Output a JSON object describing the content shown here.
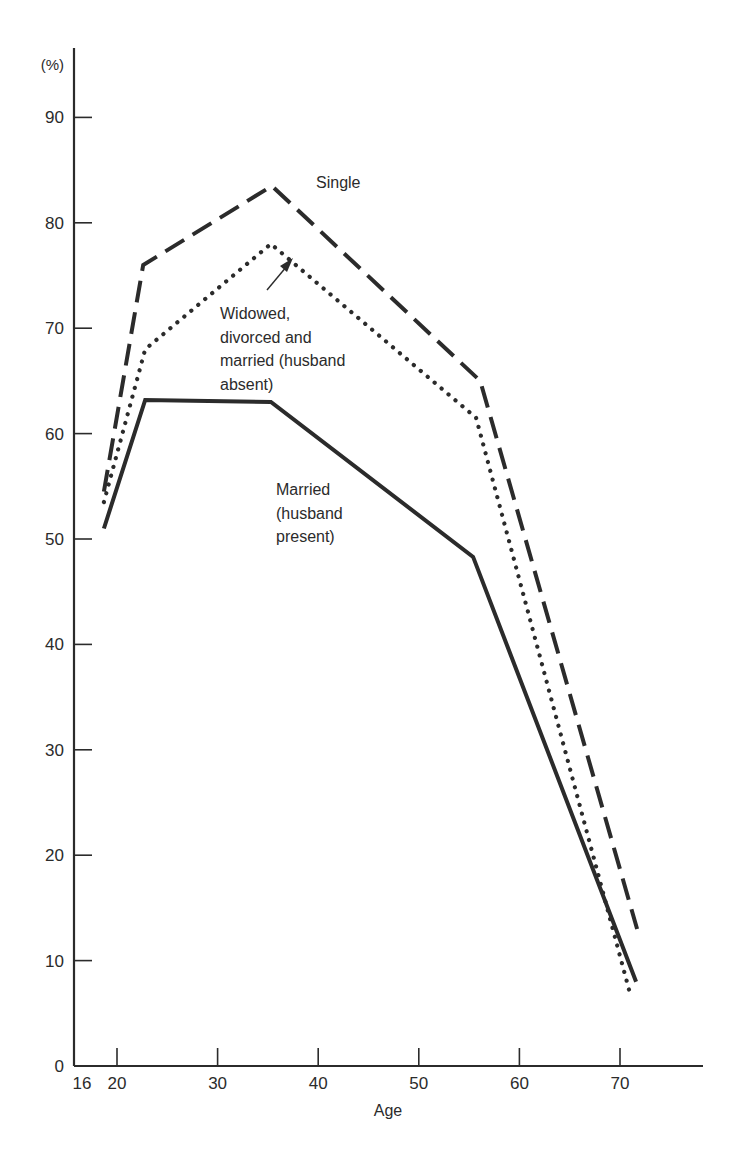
{
  "chart_data": {
    "type": "line",
    "title": "",
    "xlabel": "Age",
    "ylabel": "(%)",
    "xlim": [
      16,
      78
    ],
    "ylim": [
      0,
      95
    ],
    "grid": false,
    "legend": "inline annotations",
    "x_ticks": [
      16,
      20,
      30,
      40,
      50,
      60,
      70
    ],
    "y_ticks": [
      0,
      10,
      20,
      30,
      40,
      50,
      60,
      70,
      80,
      90
    ],
    "series": [
      {
        "name": "Single",
        "style": "dashed",
        "x": [
          18.7,
          22.6,
          35.4,
          56.1,
          71.7
        ],
        "values": [
          54.5,
          76,
          83.5,
          65,
          13
        ]
      },
      {
        "name": "Widowed, divorced and married (husband absent)",
        "style": "dotted",
        "x": [
          18.7,
          22.8,
          35.3,
          55.7,
          71.1
        ],
        "values": [
          53.5,
          68,
          78,
          61.5,
          6.5
        ]
      },
      {
        "name": "Married (husband present)",
        "style": "solid",
        "x": [
          18.7,
          22.8,
          35.3,
          55.4,
          71.6
        ],
        "values": [
          51,
          63.2,
          63,
          48.3,
          8
        ]
      }
    ],
    "annotations": [
      {
        "text": "Single",
        "lines": [
          "Single"
        ]
      },
      {
        "text": "Widowed, divorced and married (husband absent)",
        "lines": [
          "Widowed,",
          "divorced and",
          "married (husband",
          "absent)"
        ],
        "arrow": true
      },
      {
        "text": "Married (husband present)",
        "lines": [
          "Married",
          "(husband",
          "present)"
        ]
      }
    ]
  },
  "axis": {
    "y_unit_label": "(%)",
    "x_title": "Age",
    "x_origin_label": "16",
    "y_origin_label": "0"
  },
  "colors": {
    "ink": "#2b2b2b",
    "background": "#ffffff"
  }
}
